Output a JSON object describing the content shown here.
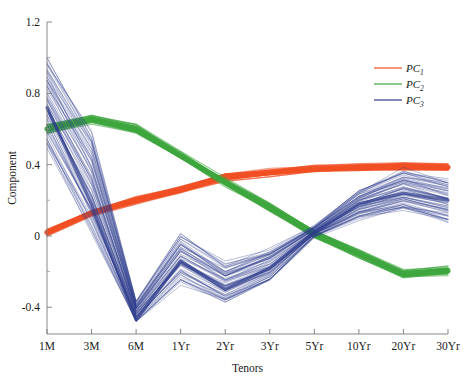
{
  "chart_data": {
    "type": "line",
    "title": "",
    "xlabel": "Tenors",
    "ylabel": "Component",
    "categories": [
      "1M",
      "3M",
      "6M",
      "1Yr",
      "2Yr",
      "3Yr",
      "5Yr",
      "10Yr",
      "20Yr",
      "30Yr"
    ],
    "ylim": [
      -0.55,
      1.2
    ],
    "yticks": [
      1.2,
      0.8,
      0.4,
      0,
      -0.4
    ],
    "ytick_labels": [
      "1.2",
      "0.8",
      "0.4",
      "0",
      "-0.4"
    ],
    "grid": false,
    "legend_position": "top-right",
    "series": [
      {
        "name": "PC1",
        "label": "PC",
        "subscript": "1",
        "color": "#F04E23",
        "values": [
          0.02,
          0.13,
          0.2,
          0.26,
          0.33,
          0.355,
          0.375,
          0.385,
          0.39,
          0.385
        ],
        "band": 0.035
      },
      {
        "name": "PC2",
        "label": "PC",
        "subscript": "2",
        "color": "#3DA53D",
        "values": [
          0.6,
          0.655,
          0.6,
          0.45,
          0.3,
          0.16,
          0.01,
          -0.1,
          -0.215,
          -0.195
        ],
        "band": 0.04
      },
      {
        "name": "PC3",
        "label": "PC",
        "subscript": "3",
        "color": "#2E3B8C",
        "values": [
          0.72,
          0.18,
          -0.47,
          -0.14,
          -0.3,
          -0.18,
          0.02,
          0.18,
          0.24,
          0.2
        ],
        "band": 0.33,
        "note": "wide bundle of many simulated loading paths"
      }
    ],
    "annotations": {
      "pc3_spread_1M": [
        0.4,
        1.04
      ],
      "pc3_spread_3M": [
        -0.12,
        0.62
      ],
      "pc3_spread_6M": [
        -0.51,
        -0.36
      ],
      "pc3_spread_1Yr": [
        -0.32,
        0.03
      ],
      "pc3_spread_2Yr": [
        -0.42,
        -0.14
      ],
      "pc3_spread_3Yr": [
        -0.3,
        -0.06
      ],
      "pc3_spread_5Yr": [
        -0.02,
        0.06
      ],
      "pc3_spread_10Yr": [
        0.06,
        0.27
      ],
      "pc3_spread_20Yr": [
        0.09,
        0.39
      ],
      "pc3_spread_30Yr": [
        0.02,
        0.33
      ]
    }
  },
  "legend": {
    "items": [
      {
        "label": "PC",
        "sub": "1"
      },
      {
        "label": "PC",
        "sub": "2"
      },
      {
        "label": "PC",
        "sub": "3"
      }
    ]
  }
}
